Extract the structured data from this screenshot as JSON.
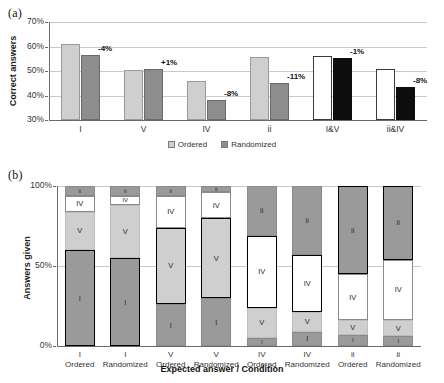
{
  "figure": {
    "panel_a_tag": "(a)",
    "panel_b_tag": "(b)"
  },
  "chart_data": [
    {
      "id": "panel_a",
      "type": "bar",
      "title": "",
      "xlabel": "",
      "ylabel": "Correct answers",
      "ylim": [
        30,
        70
      ],
      "ytick_labels": [
        "30%",
        "40%",
        "50%",
        "60%",
        "70%"
      ],
      "ytick_values": [
        30,
        40,
        50,
        60,
        70
      ],
      "grid": true,
      "legend_position": "bottom",
      "categories": [
        "I",
        "V",
        "IV",
        "ii",
        "I&V",
        "ii&IV"
      ],
      "series": [
        {
          "name": "Ordered",
          "values": [
            61.0,
            50.3,
            46.0,
            55.8,
            56.0,
            51.0
          ]
        },
        {
          "name": "Randomized",
          "values": [
            56.7,
            50.7,
            38.0,
            45.0,
            55.2,
            43.5
          ]
        }
      ],
      "delta_labels": [
        "-4%",
        "+1%",
        "-8%",
        "-11%",
        "-1%",
        "-8%"
      ],
      "legend": [
        {
          "label": "Ordered",
          "color": "#cfcfcf"
        },
        {
          "label": "Randomized",
          "color": "#8d8d8d"
        }
      ]
    },
    {
      "id": "panel_b",
      "type": "bar",
      "stacked": true,
      "title": "",
      "xlabel": "Expected answer / Condition",
      "ylabel": "Answers given",
      "ylim": [
        0,
        100
      ],
      "ytick_labels": [
        "0%",
        "50%",
        "100%"
      ],
      "ytick_values": [
        0,
        50,
        100
      ],
      "grid": true,
      "categories": [
        {
          "expected": "I",
          "condition": "Ordered"
        },
        {
          "expected": "I",
          "condition": "Randomized"
        },
        {
          "expected": "V",
          "condition": "Ordered"
        },
        {
          "expected": "V",
          "condition": "Randomized"
        },
        {
          "expected": "IV",
          "condition": "Ordered"
        },
        {
          "expected": "IV",
          "condition": "Randomized"
        },
        {
          "expected": "ii",
          "condition": "Ordered"
        },
        {
          "expected": "ii",
          "condition": "Randomized"
        }
      ],
      "stack_order": [
        "I",
        "V",
        "IV",
        "ii"
      ],
      "series": [
        {
          "name": "I",
          "values": [
            60,
            55,
            26,
            30,
            5,
            9,
            7,
            6
          ]
        },
        {
          "name": "V",
          "values": [
            24,
            33,
            48,
            50,
            19,
            12,
            9,
            10
          ]
        },
        {
          "name": "IV",
          "values": [
            10,
            6,
            20,
            16,
            45,
            36,
            29,
            38
          ]
        },
        {
          "name": "ii",
          "values": [
            6,
            6,
            6,
            4,
            31,
            43,
            55,
            46
          ]
        }
      ],
      "highlight_note": "Segment matching the expected answer is outlined in bold"
    }
  ]
}
